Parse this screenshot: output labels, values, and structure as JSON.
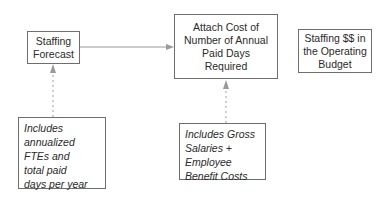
{
  "diagram": {
    "boxes": [
      {
        "id": "staffing-forecast",
        "lines": [
          "Staffing",
          "Forecast"
        ]
      },
      {
        "id": "attach-cost",
        "lines": [
          "Attach Cost of",
          "Number of Annual",
          "Paid Days",
          "Required"
        ]
      },
      {
        "id": "staffing-budget",
        "lines": [
          "Staffing $$ in",
          "the Operating",
          "Budget"
        ]
      }
    ],
    "notes": [
      {
        "id": "forecast-note",
        "lines": [
          "Includes",
          "annualized",
          "FTEs and",
          "total paid",
          "days per year"
        ]
      },
      {
        "id": "cost-note",
        "lines": [
          "Includes Gross",
          "Salaries +",
          "Employee",
          "Benefit Costs"
        ]
      }
    ],
    "equals_sign": "=",
    "colors": {
      "border": "#6e6e6e",
      "arrow": "#9a9a9a",
      "text": "#2a2a2a"
    }
  }
}
